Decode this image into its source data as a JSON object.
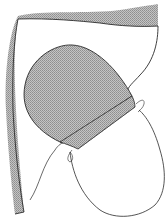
{
  "figure": {
    "type": "sewing-illustration",
    "colors": {
      "background": "#ffffff",
      "line": "#2a2a2a",
      "shade": "#b8b8b8",
      "hatch": "#8c8c8c"
    },
    "elements": [
      {
        "name": "outer-fabric-panel",
        "shaded_edge": true
      },
      {
        "name": "shaded-patch",
        "shaded": true
      },
      {
        "name": "patch-hem-band",
        "shaded": true
      },
      {
        "name": "lower-loop-fabric",
        "shaded": false
      },
      {
        "name": "thread",
        "shaded": false
      }
    ]
  }
}
